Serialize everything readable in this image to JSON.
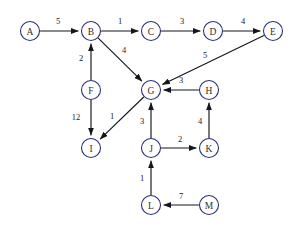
{
  "diagram": {
    "background_color": "#ffffff",
    "node_stroke_color": "#2b2f7a",
    "node_fill_color": "#ffffff",
    "node_label_color": "#3a2c1e",
    "edge_color": "#15161c",
    "node_radius": 9.5,
    "nodes": [
      {
        "id": "A",
        "label": "A",
        "x": 30,
        "y": 31
      },
      {
        "id": "B",
        "label": "B",
        "x": 91,
        "y": 31
      },
      {
        "id": "C",
        "label": "C",
        "x": 151,
        "y": 31
      },
      {
        "id": "D",
        "label": "D",
        "x": 213,
        "y": 31
      },
      {
        "id": "E",
        "label": "E",
        "x": 273,
        "y": 31
      },
      {
        "id": "F",
        "label": "F",
        "x": 91,
        "y": 90
      },
      {
        "id": "G",
        "label": "G",
        "x": 151,
        "y": 90
      },
      {
        "id": "H",
        "label": "H",
        "x": 209,
        "y": 90
      },
      {
        "id": "I",
        "label": "I",
        "x": 91,
        "y": 148
      },
      {
        "id": "J",
        "label": "J",
        "x": 151,
        "y": 148
      },
      {
        "id": "K",
        "label": "K",
        "x": 209,
        "y": 148
      },
      {
        "id": "L",
        "label": "L",
        "x": 151,
        "y": 205
      },
      {
        "id": "M",
        "label": "M",
        "x": 209,
        "y": 205
      }
    ],
    "edges": [
      {
        "from": "A",
        "to": "B",
        "weight": "5",
        "label_x": 58,
        "label_y": 21
      },
      {
        "from": "B",
        "to": "C",
        "weight": "1",
        "label_x": 120,
        "label_y": 21
      },
      {
        "from": "C",
        "to": "D",
        "weight": "3",
        "label_x": 182,
        "label_y": 21
      },
      {
        "from": "D",
        "to": "E",
        "weight": "4",
        "label_x": 243,
        "label_y": 21
      },
      {
        "from": "B",
        "to": "G",
        "weight": "4",
        "label_x": 124,
        "label_y": 50
      },
      {
        "from": "E",
        "to": "G",
        "weight": "5",
        "label_x": 205,
        "label_y": 55
      },
      {
        "from": "F",
        "to": "B",
        "weight": "2",
        "label_x": 81,
        "label_y": 58
      },
      {
        "from": "F",
        "to": "I",
        "weight": "12",
        "label_x": 76,
        "label_y": 117
      },
      {
        "from": "G",
        "to": "I",
        "weight": "1",
        "label_x": 112,
        "label_y": 116
      },
      {
        "from": "H",
        "to": "G",
        "weight": "3",
        "label_x": 181,
        "label_y": 80
      },
      {
        "from": "J",
        "to": "G",
        "weight": "3",
        "label_x": 142,
        "label_y": 121
      },
      {
        "from": "J",
        "to": "K",
        "weight": "2",
        "label_x": 180,
        "label_y": 139
      },
      {
        "from": "K",
        "to": "H",
        "weight": "4",
        "label_x": 200,
        "label_y": 121
      },
      {
        "from": "L",
        "to": "J",
        "weight": "1",
        "label_x": 142,
        "label_y": 178
      },
      {
        "from": "M",
        "to": "L",
        "weight": "7",
        "label_x": 181,
        "label_y": 196
      }
    ]
  }
}
